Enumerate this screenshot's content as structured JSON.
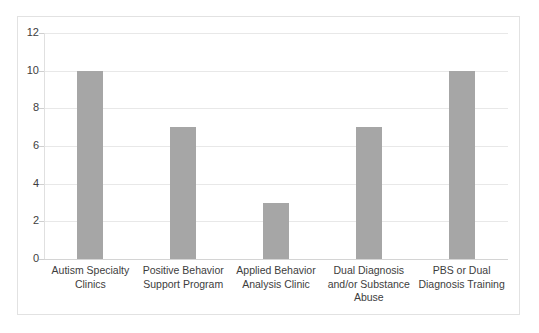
{
  "chart_data": {
    "type": "bar",
    "title": "",
    "subtitle": "",
    "xlabel": "",
    "ylabel": "",
    "categories": [
      "Autism Specialty Clinics",
      "Positive Behavior Support Program",
      "Applied Behavior Analysis Clinic",
      "Dual Diagnosis and/or Substance Abuse",
      "PBS or Dual Diagnosis Training"
    ],
    "values": [
      10,
      7,
      3,
      7,
      10
    ],
    "ylim": [
      0,
      12
    ],
    "ytick_labels": [
      "0",
      "2",
      "4",
      "6",
      "8",
      "10",
      "12"
    ],
    "ytick_values": [
      0,
      2,
      4,
      6,
      8,
      10,
      12
    ],
    "grid": true,
    "legend": false,
    "legend_position": "none",
    "bar_color": "#a6a6a6",
    "gridline_color": "#e8e8e8",
    "axis_color": "#d4d4d4",
    "frame_color": "#e2e2e2",
    "text_color": "#3d3d3d",
    "background": "#ffffff"
  }
}
